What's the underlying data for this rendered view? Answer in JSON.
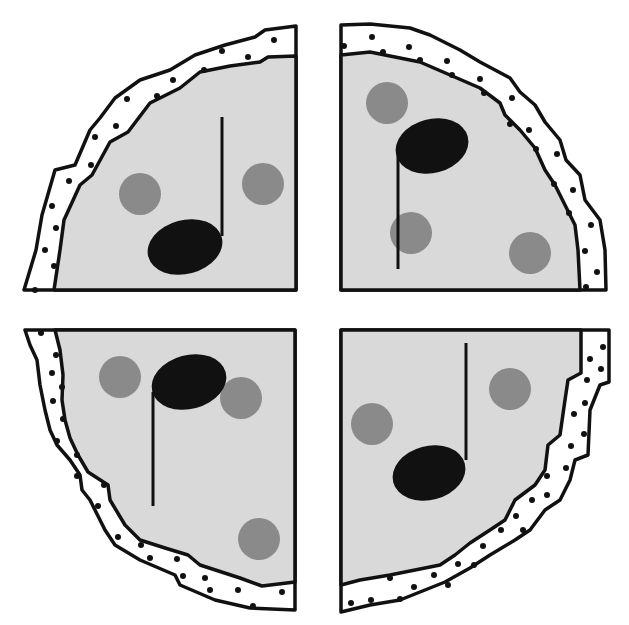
{
  "illustration": {
    "subject": "Pizza cut into four quarters, each topped with a music note and pepperoni",
    "colors": {
      "background": "#ffffff",
      "cheese": "#d9d9d9",
      "pepperoni": "#8a8a8a",
      "note": "#111111",
      "outline": "#111111",
      "crust": "#ffffff"
    },
    "slices": [
      {
        "id": "top-left",
        "note_head": {
          "cx": 185,
          "cy": 247,
          "rx": 38,
          "ry": 27,
          "rot": -15
        },
        "stem": {
          "x": 222,
          "y1": 117,
          "y2": 236
        },
        "pepperoni": [
          {
            "cx": 140,
            "cy": 194,
            "r": 21
          },
          {
            "cx": 263,
            "cy": 184,
            "r": 21
          }
        ]
      },
      {
        "id": "top-right",
        "note_head": {
          "cx": 432,
          "cy": 146,
          "rx": 37,
          "ry": 27,
          "rot": -15
        },
        "stem": {
          "x": 398,
          "y1": 156,
          "y2": 269
        },
        "pepperoni": [
          {
            "cx": 387,
            "cy": 103,
            "r": 21
          },
          {
            "cx": 411,
            "cy": 233,
            "r": 21
          },
          {
            "cx": 530,
            "cy": 253,
            "r": 21
          }
        ]
      },
      {
        "id": "bottom-left",
        "note_head": {
          "cx": 189,
          "cy": 382,
          "rx": 38,
          "ry": 27,
          "rot": -15
        },
        "stem": {
          "x": 153,
          "y1": 392,
          "y2": 506
        },
        "pepperoni": [
          {
            "cx": 120,
            "cy": 377,
            "r": 21
          },
          {
            "cx": 241,
            "cy": 398,
            "r": 21
          },
          {
            "cx": 259,
            "cy": 539,
            "r": 21
          }
        ]
      },
      {
        "id": "bottom-right",
        "note_head": {
          "cx": 429,
          "cy": 473,
          "rx": 37,
          "ry": 27,
          "rot": -15
        },
        "stem": {
          "x": 466,
          "y1": 343,
          "y2": 460
        },
        "pepperoni": [
          {
            "cx": 372,
            "cy": 424,
            "r": 21
          },
          {
            "cx": 510,
            "cy": 389,
            "r": 21
          }
        ]
      }
    ]
  }
}
